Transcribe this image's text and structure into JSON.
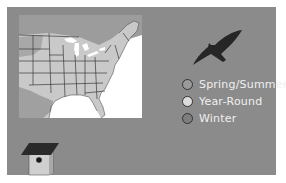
{
  "legend": {
    "items": [
      {
        "label": "Spring/Summer",
        "color": "#9a9a9a"
      },
      {
        "label": "Year-Round",
        "color": "#d8d8d8"
      },
      {
        "label": "Winter",
        "color": "#7e7e7e"
      }
    ]
  },
  "colors": {
    "panel": "#8b8b8b",
    "ocean": "#ffffff",
    "year_round": "#c9c9c9",
    "spring_summer": "#9a9a9a",
    "state_lines": "#3a3a3a",
    "bird": "#262626"
  },
  "icons": {
    "bird": "bird-silhouette-icon",
    "birdhouse": "birdhouse-icon"
  }
}
